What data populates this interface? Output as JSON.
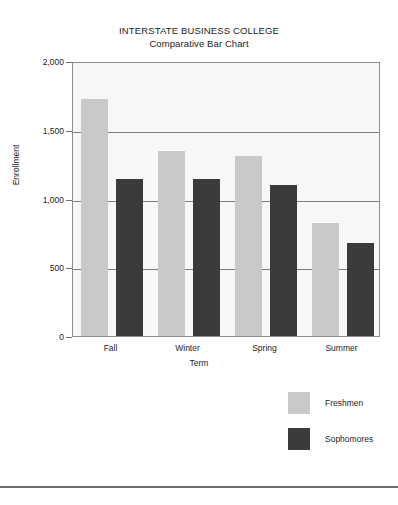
{
  "chart_data": {
    "type": "bar",
    "title": "INTERSTATE BUSINESS COLLEGE",
    "subtitle": "Comparative Bar Chart",
    "xlabel": "Term",
    "ylabel": "Enrollment",
    "categories": [
      "Fall",
      "Winter",
      "Spring",
      "Summer"
    ],
    "series": [
      {
        "name": "Freshmen",
        "color": "#c9c9c9",
        "values": [
          1725,
          1345,
          1310,
          820
        ]
      },
      {
        "name": "Sophomores",
        "color": "#3b3b3b",
        "values": [
          1140,
          1140,
          1100,
          675
        ]
      }
    ],
    "ylim": [
      0,
      2000
    ],
    "yticks": [
      0,
      500,
      1000,
      1500,
      2000
    ],
    "ytick_labels": [
      "0",
      "500",
      "1,000",
      "1,500",
      "2,000"
    ],
    "grid": true,
    "legend_position": "bottom-right"
  }
}
